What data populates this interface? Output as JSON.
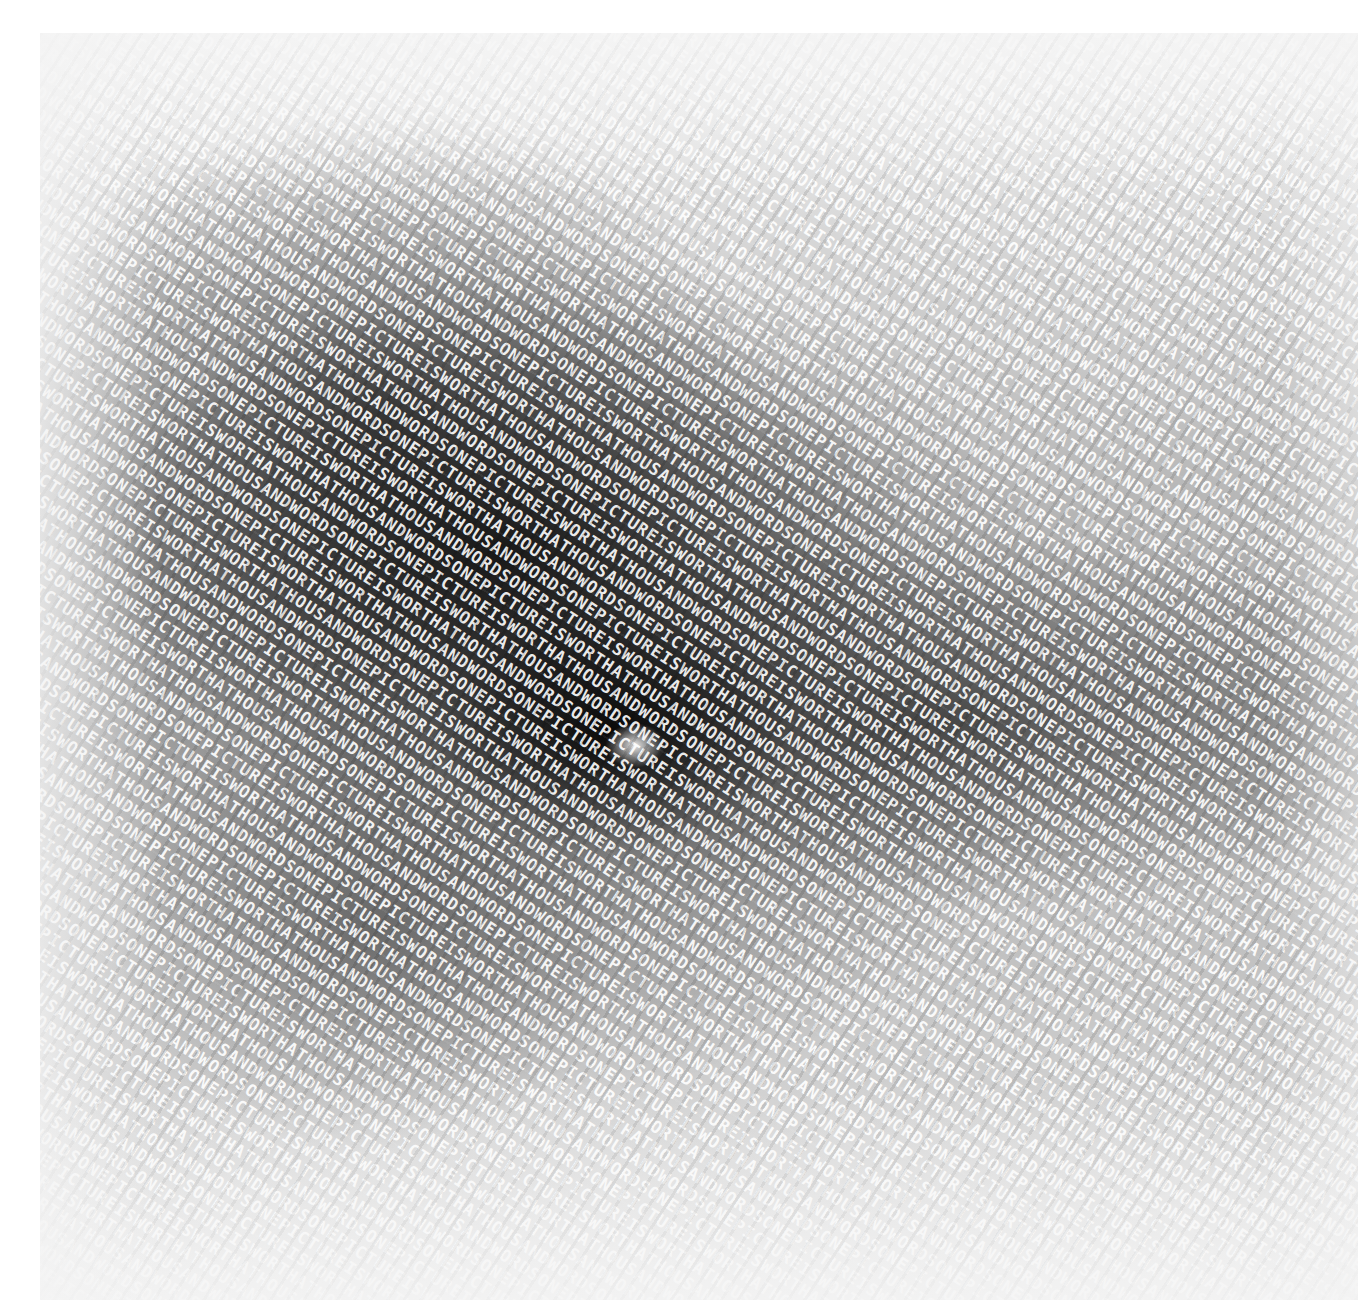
{
  "artwork": {
    "kind": "typographic halftone portrait",
    "repeated_phrase": "ONE PICTURE IS WORTH A THOUSAND WORDS",
    "phrase_words": [
      "ONE",
      "PICTURE",
      "IS",
      "WORTH",
      "A",
      "THOUSAND",
      "WORDS"
    ],
    "text_angle_degrees": 33,
    "palette": {
      "paper": "#ffffff",
      "light_tone": "#f4f4f4",
      "ink": "#000000",
      "glyph": "#ffffff"
    },
    "frame": {
      "left": 40,
      "top": 33,
      "width": 1318,
      "height": 1267
    }
  }
}
